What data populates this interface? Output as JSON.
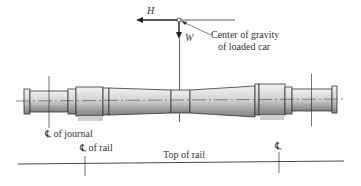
{
  "diagram": {
    "type": "engineering-drawing",
    "forces": {
      "horizontal": {
        "symbol": "H",
        "direction": "left"
      },
      "vertical": {
        "symbol": "W",
        "direction": "down"
      }
    },
    "labels": {
      "cg_line1": "Center of gravity",
      "cg_line2": "of loaded car",
      "journal": "of journal",
      "rail": "of rail",
      "top_of_rail": "Top of rail",
      "centerline_symbol": "℄"
    },
    "colors": {
      "line": "#222222",
      "axle_light": "#e6e6e6",
      "axle_dark": "#8a8a8a",
      "wheel_seat_shadow": "#d0d0d0"
    }
  }
}
